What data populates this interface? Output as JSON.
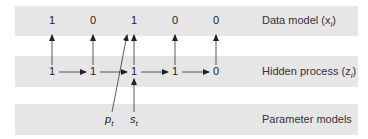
{
  "bands": {
    "data_model": {
      "label": "Data model (x",
      "var_sub": "i",
      "close": ")"
    },
    "hidden_process": {
      "label": "Hidden process (z",
      "var_sub": "i",
      "close": ")"
    },
    "parameter_models": {
      "label": "Parameter models"
    }
  },
  "data_nodes": [
    "1",
    "0",
    "1",
    "0",
    "0"
  ],
  "hidden_nodes": [
    "1",
    "1",
    "1",
    "1",
    "0"
  ],
  "parameters": {
    "p": {
      "symbol": "p",
      "sub": "t"
    },
    "s": {
      "symbol": "s",
      "sub": "t"
    }
  },
  "colors": {
    "band": "#e6e6e6",
    "ink": "#222222"
  }
}
